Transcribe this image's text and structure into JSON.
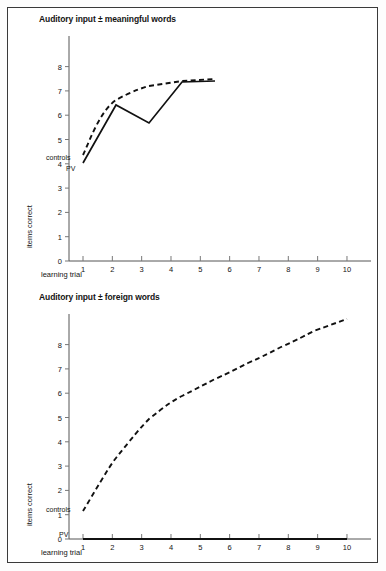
{
  "figure": {
    "background_color": "#ffffff",
    "frame_color": "#3a3a3a",
    "line_color": "#111111"
  },
  "panels": [
    {
      "id": "meaningful-words",
      "title": "Auditory input ± meaningful words",
      "xlabel": "learning trial",
      "ylabel": "items correct",
      "label_controls": "controls",
      "label_pv": "PV"
    },
    {
      "id": "foreign-words",
      "title": "Auditory input ± foreign words",
      "xlabel": "learning trial",
      "ylabel": "items correct",
      "label_controls": "controls",
      "label_pv": "PV"
    }
  ],
  "ticks": {
    "x": [
      "1",
      "2",
      "3",
      "4",
      "5",
      "6",
      "7",
      "8",
      "9",
      "10"
    ],
    "y": [
      "0",
      "1",
      "2",
      "3",
      "4",
      "5",
      "6",
      "7",
      "8"
    ]
  },
  "chart_data": [
    {
      "type": "line",
      "title": "Auditory input ± meaningful words",
      "xlabel": "learning trial",
      "ylabel": "items correct",
      "xlim": [
        1,
        10
      ],
      "ylim": [
        0,
        8.6
      ],
      "xticks": [
        1,
        2,
        3,
        4,
        5,
        6,
        7,
        8,
        9,
        10
      ],
      "yticks": [
        0,
        1,
        2,
        3,
        4,
        5,
        6,
        7,
        8
      ],
      "grid": false,
      "legend": "inline-labels",
      "series": [
        {
          "name": "controls",
          "style": "dashed",
          "x": [
            1,
            2,
            3,
            4,
            5
          ],
          "values": [
            4.1,
            7.1,
            7.7,
            8.0,
            8.15
          ]
        },
        {
          "name": "PV",
          "style": "solid",
          "x": [
            1,
            2,
            3,
            4,
            5
          ],
          "values": [
            3.75,
            6.75,
            6.1,
            7.85,
            7.9
          ]
        }
      ]
    },
    {
      "type": "line",
      "title": "Auditory input ± foreign words",
      "xlabel": "learning trial",
      "ylabel": "items correct",
      "xlim": [
        1,
        10
      ],
      "ylim": [
        0,
        8.6
      ],
      "xticks": [
        1,
        2,
        3,
        4,
        5,
        6,
        7,
        8,
        9,
        10
      ],
      "yticks": [
        0,
        1,
        2,
        3,
        4,
        5,
        6,
        7,
        8
      ],
      "grid": false,
      "legend": "inline-labels",
      "series": [
        {
          "name": "controls",
          "style": "dashed",
          "x": [
            1,
            2,
            3,
            4,
            5,
            6,
            7,
            8,
            9,
            10
          ],
          "values": [
            1.1,
            2.9,
            4.1,
            4.9,
            5.5,
            6.1,
            6.6,
            7.05,
            7.5,
            8.0
          ]
        },
        {
          "name": "PV",
          "style": "solid",
          "x": [
            1,
            2,
            3,
            4,
            5,
            6,
            7,
            8,
            9,
            10
          ],
          "values": [
            0,
            0,
            0,
            0,
            0,
            0,
            0,
            0,
            0,
            0
          ]
        }
      ]
    }
  ]
}
